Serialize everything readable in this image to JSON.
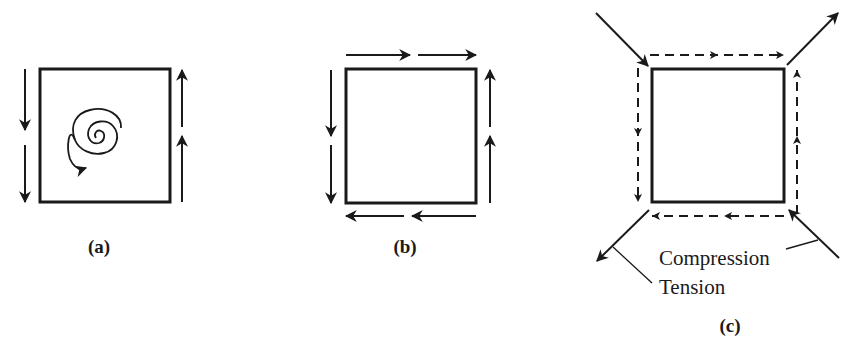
{
  "figure": {
    "panels": [
      {
        "id": "a",
        "label": "(a)",
        "description": "Square element with shear arrows on left (down) and right (up) sides and a rotation spiral inside"
      },
      {
        "id": "b",
        "label": "(b)",
        "description": "Square element in pure shear: top arrows right, right arrows up, bottom arrows left, left arrows down"
      },
      {
        "id": "c",
        "label": "(c)",
        "description": "Pure shear element with dashed shear arrows and diagonal principal stress arrows"
      }
    ],
    "annotations": {
      "compression": "Compression",
      "tension": "Tension"
    },
    "colors": {
      "stroke": "#1a1a1a",
      "background": "#ffffff"
    }
  }
}
